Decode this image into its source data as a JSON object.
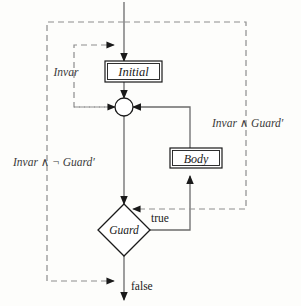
{
  "diagram": {
    "colors": {
      "background": "#fdfdfb",
      "solid_edge": "#6b6b6b",
      "dashed_edge": "#8d8d8d",
      "node_stroke": "#1a1a1a",
      "node_fill": "#ffffff",
      "text": "#1a1a1a",
      "annotation_text": "#3a3a3a"
    },
    "nodes": [
      {
        "id": "initial",
        "label": "Initial",
        "shape": "rectangle",
        "x": 133,
        "y": 71
      },
      {
        "id": "merge",
        "label": "",
        "shape": "circle",
        "x": 124,
        "y": 107
      },
      {
        "id": "body",
        "label": "Body",
        "shape": "rectangle",
        "x": 196,
        "y": 162
      },
      {
        "id": "guard",
        "label": "Guard",
        "shape": "diamond",
        "x": 124,
        "y": 230
      }
    ],
    "edge_labels": [
      {
        "id": "true-label",
        "text": "true",
        "x": 151,
        "y": 219
      },
      {
        "id": "false-label",
        "text": "false",
        "x": 131,
        "y": 287
      }
    ],
    "annotations": [
      {
        "id": "invar-initial",
        "text": "Invar",
        "x": 66,
        "y": 75
      },
      {
        "id": "invar-and-guard-prime",
        "text": "Invar ∧ Guard′",
        "x": 212,
        "y": 124
      },
      {
        "id": "invar-and-not-guard-prime",
        "text": "Invar ∧ ¬ Guard′",
        "x": 13,
        "y": 163
      }
    ],
    "flow": {
      "entry": "top",
      "exit": "bottom",
      "loop_back_source": "body",
      "loop_back_target": "merge",
      "true_branch_target": "body",
      "false_branch_target": "exit"
    }
  }
}
